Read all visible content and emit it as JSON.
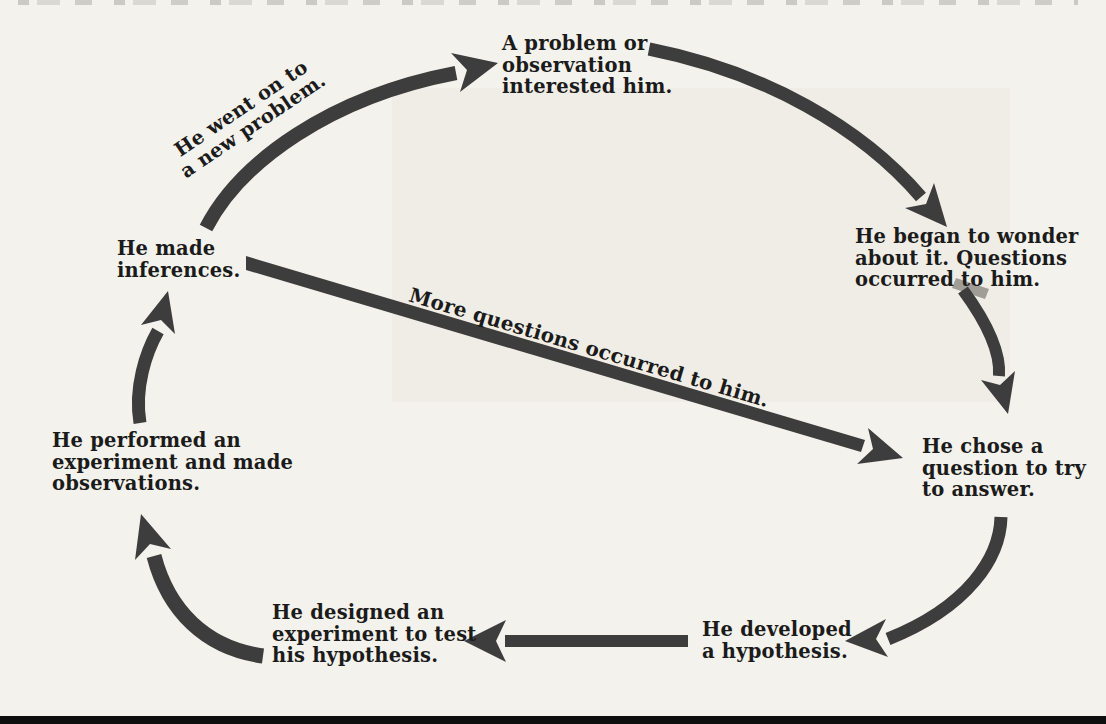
{
  "page": {
    "background": "#f4f2ec",
    "text_color": "#1b1b1b",
    "arrow_color": "#3d3d3d",
    "bottom_edge_color": "#0e0e0e"
  },
  "diagram": {
    "type": "cycle-flowchart",
    "nodes": [
      {
        "id": "problem",
        "lines": [
          "A problem or",
          "observation",
          "interested him."
        ]
      },
      {
        "id": "wonder",
        "lines": [
          "He began to wonder",
          "about it. Questions",
          "occurred to him."
        ]
      },
      {
        "id": "chose",
        "lines": [
          "He chose a",
          "question to try",
          "to answer."
        ]
      },
      {
        "id": "hypothesis",
        "lines": [
          "He developed",
          "a hypothesis."
        ]
      },
      {
        "id": "designed",
        "lines": [
          "He designed an",
          "experiment to test",
          "his hypothesis."
        ]
      },
      {
        "id": "performed",
        "lines": [
          "He performed an",
          "experiment and made",
          "observations."
        ]
      },
      {
        "id": "inferences",
        "lines": [
          "He made",
          "inferences."
        ]
      }
    ],
    "arrow_labels": [
      {
        "id": "new-problem",
        "line1": "He went on to",
        "line2": "a new problem."
      },
      {
        "id": "more-questions",
        "text": "More questions occurred to him."
      }
    ],
    "arrows": [
      {
        "from": "inferences",
        "to": "problem",
        "label": "He went on to a new problem."
      },
      {
        "from": "problem",
        "to": "wonder",
        "label": ""
      },
      {
        "from": "wonder",
        "to": "chose",
        "label": ""
      },
      {
        "from": "inferences",
        "to": "chose",
        "label": "More questions occurred to him."
      },
      {
        "from": "chose",
        "to": "hypothesis",
        "label": ""
      },
      {
        "from": "hypothesis",
        "to": "designed",
        "label": ""
      },
      {
        "from": "designed",
        "to": "performed",
        "label": ""
      },
      {
        "from": "performed",
        "to": "inferences",
        "label": ""
      }
    ]
  }
}
